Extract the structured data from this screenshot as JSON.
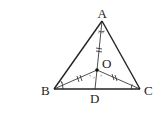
{
  "diagram": {
    "points": {
      "A": {
        "label": "A",
        "x": 102,
        "y": 21
      },
      "B": {
        "label": "B",
        "x": 54,
        "y": 89
      },
      "C": {
        "label": "C",
        "x": 140,
        "y": 89
      },
      "O": {
        "label": "O",
        "x": 97,
        "y": 70
      },
      "D": {
        "label": "D",
        "x": 95,
        "y": 89
      }
    },
    "segments": [
      "AB",
      "AC",
      "BC",
      "AO",
      "OD",
      "BO",
      "CO"
    ],
    "equal_marks": [
      "AO",
      "BO",
      "CO"
    ],
    "angle_marks": [
      "A-split",
      "B",
      "C",
      "O"
    ]
  }
}
